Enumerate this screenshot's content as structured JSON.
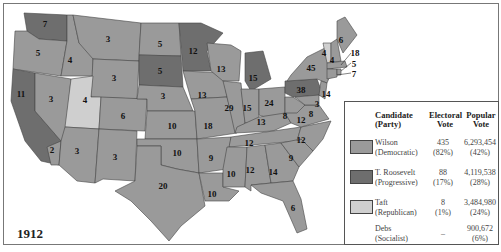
{
  "map": {
    "year": "1912",
    "colors": {
      "wilson": "#9a9a9a",
      "roosevelt": "#6e6e6e",
      "taft": "#cfcfcf",
      "border": "#444444",
      "water": "#ffffff"
    },
    "state_labels": [
      {
        "state": "WA",
        "votes": "7",
        "party": "roosevelt"
      },
      {
        "state": "OR",
        "votes": "5",
        "party": "wilson"
      },
      {
        "state": "CA",
        "votes": "11",
        "party": "roosevelt",
        "note": "2 of CA votes to Wilson"
      },
      {
        "state": "CA-south",
        "votes": "2",
        "party": "wilson"
      },
      {
        "state": "ID",
        "votes": "4",
        "party": "wilson"
      },
      {
        "state": "NV",
        "votes": "3",
        "party": "wilson"
      },
      {
        "state": "UT",
        "votes": "4",
        "party": "taft"
      },
      {
        "state": "AZ",
        "votes": "3",
        "party": "wilson"
      },
      {
        "state": "MT",
        "votes": "3",
        "party": "wilson"
      },
      {
        "state": "WY",
        "votes": "3",
        "party": "wilson"
      },
      {
        "state": "CO",
        "votes": "6",
        "party": "wilson"
      },
      {
        "state": "NM",
        "votes": "3",
        "party": "wilson"
      },
      {
        "state": "ND",
        "votes": "5",
        "party": "wilson"
      },
      {
        "state": "SD",
        "votes": "5",
        "party": "roosevelt"
      },
      {
        "state": "NE",
        "votes": "8",
        "party": "wilson"
      },
      {
        "state": "KS",
        "votes": "10",
        "party": "wilson"
      },
      {
        "state": "OK",
        "votes": "10",
        "party": "wilson"
      },
      {
        "state": "TX",
        "votes": "20",
        "party": "wilson"
      },
      {
        "state": "MN",
        "votes": "12",
        "party": "roosevelt"
      },
      {
        "state": "IA",
        "votes": "13",
        "party": "wilson"
      },
      {
        "state": "MO",
        "votes": "18",
        "party": "wilson"
      },
      {
        "state": "AR",
        "votes": "9",
        "party": "wilson"
      },
      {
        "state": "LA",
        "votes": "10",
        "party": "wilson"
      },
      {
        "state": "WI",
        "votes": "13",
        "party": "wilson"
      },
      {
        "state": "IL",
        "votes": "29",
        "party": "wilson"
      },
      {
        "state": "MI",
        "votes": "15",
        "party": "roosevelt"
      },
      {
        "state": "IN",
        "votes": "15",
        "party": "wilson"
      },
      {
        "state": "OH",
        "votes": "24",
        "party": "wilson"
      },
      {
        "state": "KY",
        "votes": "13",
        "party": "wilson"
      },
      {
        "state": "TN",
        "votes": "12",
        "party": "wilson"
      },
      {
        "state": "MS",
        "votes": "10",
        "party": "wilson"
      },
      {
        "state": "AL",
        "votes": "12",
        "party": "wilson"
      },
      {
        "state": "GA",
        "votes": "14",
        "party": "wilson"
      },
      {
        "state": "FL",
        "votes": "6",
        "party": "wilson"
      },
      {
        "state": "SC",
        "votes": "9",
        "party": "wilson"
      },
      {
        "state": "NC",
        "votes": "12",
        "party": "wilson"
      },
      {
        "state": "VA",
        "votes": "12",
        "party": "wilson"
      },
      {
        "state": "WV",
        "votes": "8",
        "party": "wilson"
      },
      {
        "state": "PA",
        "votes": "38",
        "party": "roosevelt"
      },
      {
        "state": "NY",
        "votes": "45",
        "party": "wilson"
      },
      {
        "state": "VT",
        "votes": "4",
        "party": "taft"
      },
      {
        "state": "NH",
        "votes": "4",
        "party": "wilson"
      },
      {
        "state": "ME",
        "votes": "6",
        "party": "wilson"
      },
      {
        "state": "MA",
        "votes": "18",
        "party": "wilson"
      },
      {
        "state": "RI",
        "votes": "5",
        "party": "wilson"
      },
      {
        "state": "CT",
        "votes": "7",
        "party": "wilson"
      },
      {
        "state": "NJ",
        "votes": "14",
        "party": "wilson"
      },
      {
        "state": "DE",
        "votes": "3",
        "party": "wilson"
      },
      {
        "state": "MD",
        "votes": "8",
        "party": "wilson"
      }
    ]
  },
  "legend": {
    "headers": {
      "candidate": "Candidate",
      "candidate_sub": "(Party)",
      "electoral": "Electoral",
      "electoral_sub": "Vote",
      "popular": "Popular",
      "popular_sub": "Vote"
    },
    "rows": [
      {
        "name": "Wilson",
        "party": "(Democratic)",
        "ev": "435",
        "ev_pct": "(82%)",
        "pv": "6,293,454",
        "pv_pct": "(42%)",
        "swatch": "#9a9a9a"
      },
      {
        "name": "T. Roosevelt",
        "party": "(Progressive)",
        "ev": "88",
        "ev_pct": "(17%)",
        "pv": "4,119,538",
        "pv_pct": "(28%)",
        "swatch": "#6e6e6e"
      },
      {
        "name": "Taft",
        "party": "(Republican)",
        "ev": "8",
        "ev_pct": "(1%)",
        "pv": "3,484,980",
        "pv_pct": "(24%)",
        "swatch": "#cfcfcf"
      },
      {
        "name": "Debs",
        "party": "(Socialist)",
        "ev": "–",
        "ev_pct": "",
        "pv": "900,672",
        "pv_pct": "(6%)",
        "swatch": ""
      }
    ]
  }
}
